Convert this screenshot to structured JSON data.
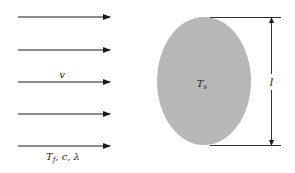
{
  "diagram": {
    "flow": {
      "arrow_count": 5,
      "velocity_label": "v",
      "properties_label": {
        "T_symbol": "T",
        "T_subscript": "f",
        "rest": ", c, λ"
      }
    },
    "body": {
      "temperature_symbol": "T",
      "temperature_subscript": "s",
      "fill_color": "#b7b7b7"
    },
    "dimension": {
      "length_label": "l"
    },
    "colors": {
      "line": "#1a1a1a",
      "background": "#ffffff"
    }
  }
}
